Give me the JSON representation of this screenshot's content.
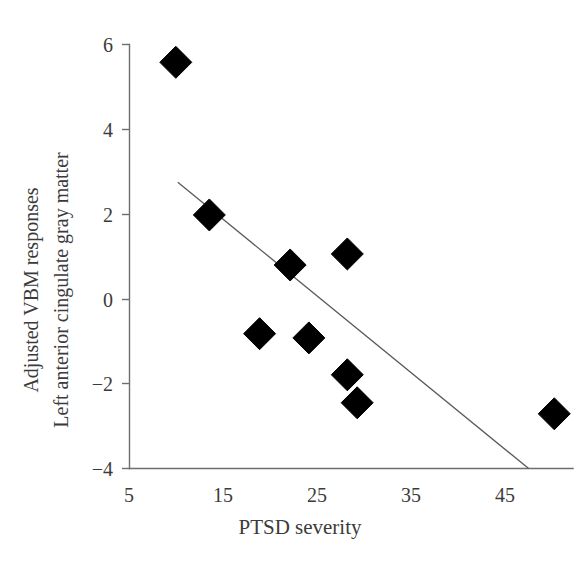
{
  "chart_data": {
    "type": "scatter",
    "title": "",
    "xlabel": "PTSD severity",
    "ylabel_line1": "Adjusted VBM responses",
    "ylabel_line2": "Left anterior cingulate gray matter",
    "xlim": [
      5,
      50
    ],
    "ylim": [
      -4,
      6
    ],
    "xticks": [
      5,
      15,
      25,
      35,
      45
    ],
    "xtick_labels": [
      "5",
      "15",
      "25",
      "35",
      "45"
    ],
    "yticks": [
      -4,
      -2,
      0,
      2,
      4,
      6
    ],
    "ytick_labels": [
      "−4",
      "−2",
      "0",
      "2",
      "4",
      "6"
    ],
    "grid": false,
    "legend": false,
    "marker_shape": "filled-diamond",
    "marker_color": "#000000",
    "points": [
      {
        "x": 9.7,
        "y": 5.58
      },
      {
        "x": 13.1,
        "y": 1.98
      },
      {
        "x": 18.2,
        "y": -0.82
      },
      {
        "x": 21.3,
        "y": 0.8
      },
      {
        "x": 23.2,
        "y": -0.92
      },
      {
        "x": 27.1,
        "y": 1.06
      },
      {
        "x": 27.1,
        "y": -1.79
      },
      {
        "x": 28.1,
        "y": -2.45
      },
      {
        "x": 48.1,
        "y": -2.71
      }
    ],
    "trendline": {
      "type": "linear-fit",
      "color": "#5a5a5a",
      "x_start": 9.9,
      "y_start": 2.75,
      "x_end": 45.5,
      "y_end": -4.0
    }
  },
  "axes": {
    "x_axis_name": "x-axis",
    "y_axis_name": "y-axis"
  }
}
